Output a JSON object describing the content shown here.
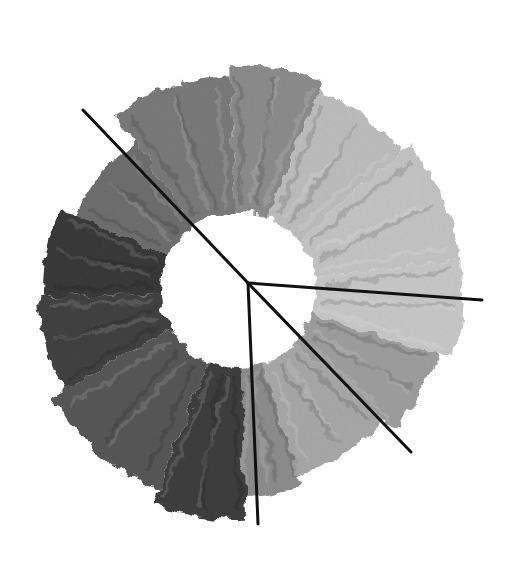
{
  "image": {
    "width": 514,
    "height": 562,
    "background": "#ffffff",
    "description": "Grayscale crayon color wheel with four black radial lines"
  },
  "wheel": {
    "center": [
      238,
      290
    ],
    "inner_radius": 78,
    "outer_radius": 195,
    "segments": [
      {
        "name": "top-left-darkish",
        "start": 205,
        "end": 235,
        "color": "#6e6e6e",
        "outer": 180
      },
      {
        "name": "top",
        "start": 235,
        "end": 268,
        "color": "#7a7a7a",
        "outer": 215
      },
      {
        "name": "top-mid",
        "start": 268,
        "end": 292,
        "color": "#8c8c8c",
        "outer": 225
      },
      {
        "name": "top-right-light",
        "start": 292,
        "end": 320,
        "color": "#bdbdbd",
        "outer": 215
      },
      {
        "name": "right-upper-light",
        "start": 320,
        "end": 352,
        "color": "#c4c4c4",
        "outer": 225
      },
      {
        "name": "right-light",
        "start": 352,
        "end": 378,
        "color": "#c8c8c8",
        "outer": 225
      },
      {
        "name": "right-lower",
        "start": 18,
        "end": 42,
        "color": "#9e9e9e",
        "outer": 210
      },
      {
        "name": "bottom-right",
        "start": 42,
        "end": 72,
        "color": "#a8a8a8",
        "outer": 195
      },
      {
        "name": "bottom-right-mid",
        "start": 72,
        "end": 88,
        "color": "#8d8d8d",
        "outer": 205
      },
      {
        "name": "bottom",
        "start": 88,
        "end": 112,
        "color": "#3f3f3f",
        "outer": 230
      },
      {
        "name": "bottom-left",
        "start": 112,
        "end": 150,
        "color": "#575757",
        "outer": 215
      },
      {
        "name": "left-dark",
        "start": 150,
        "end": 178,
        "color": "#424242",
        "outer": 200
      },
      {
        "name": "left-upper",
        "start": 178,
        "end": 205,
        "color": "#3a3a3a",
        "outer": 195
      }
    ]
  },
  "lines": {
    "origin": [
      248,
      283
    ],
    "color": "#111111",
    "width": 3,
    "endpoints": [
      {
        "name": "line-upper-left",
        "to": [
          83,
          110
        ]
      },
      {
        "name": "line-right",
        "to": [
          482,
          300
        ]
      },
      {
        "name": "line-lower-right",
        "to": [
          411,
          452
        ]
      },
      {
        "name": "line-down",
        "to": [
          258,
          524
        ]
      }
    ]
  }
}
